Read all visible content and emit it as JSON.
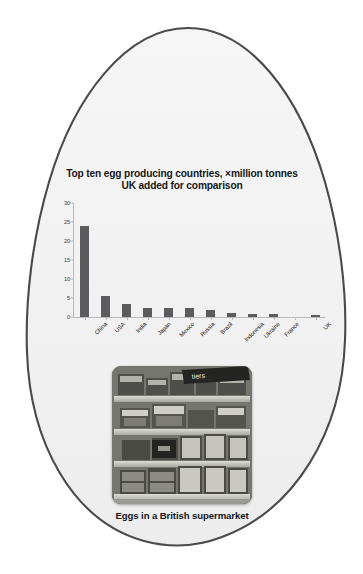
{
  "figure": {
    "shape": "egg-outline",
    "outline_color": "#4a4a4c",
    "fill_color": "#f3f3f3"
  },
  "caption": {
    "photo_caption": "Eggs in a British supermarket",
    "photo_alt": "Supermarket shelving stacked with egg boxes"
  },
  "chart_data": {
    "type": "bar",
    "title_line1": "Top ten egg producing countries, ×million tonnes",
    "title_line2": "UK added for comparison",
    "title": "Top ten egg producing countries, ×million tonnes UK added for comparison",
    "xlabel": "",
    "ylabel": "",
    "categories": [
      "China",
      "USA",
      "India",
      "Japan",
      "Mexico",
      "Russia",
      "Brazil",
      "Indonesia",
      "Ukraine",
      "France",
      "",
      "UK"
    ],
    "values": [
      24.0,
      5.4,
      3.5,
      2.5,
      2.5,
      2.4,
      1.9,
      1.1,
      0.9,
      0.85,
      null,
      0.6
    ],
    "ylim": [
      0,
      30
    ],
    "yticks": [
      0,
      5,
      10,
      15,
      20,
      25,
      30
    ],
    "ytick_labels": [
      "0",
      "5",
      "10",
      "15",
      "20",
      "25",
      "30"
    ],
    "grid": false,
    "legend": null,
    "bar_color": "#5c5c5e",
    "axis_color": "#b9b9bc"
  }
}
